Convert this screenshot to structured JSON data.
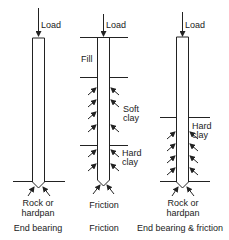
{
  "diagram": {
    "type": "pile foundation types",
    "piles": [
      {
        "id": "end-bearing",
        "load_label": "Load",
        "bearing_label": [
          "Rock or",
          "hardpan"
        ],
        "caption": "End bearing"
      },
      {
        "id": "friction",
        "load_label": "Load",
        "layers": [
          "Fill",
          "Soft clay",
          "Hard clay"
        ],
        "layer_labels": {
          "fill": "Fill",
          "soft_clay_1": "Soft",
          "soft_clay_2": "clay",
          "hard_clay_1": "Hard",
          "hard_clay_2": "clay"
        },
        "tip_label": "Friction",
        "caption": "Friction"
      },
      {
        "id": "end-bearing-friction",
        "load_label": "Load",
        "layer_labels": {
          "hard_clay_1": "Hard",
          "hard_clay_2": "clay"
        },
        "bearing_label": [
          "Rock or",
          "hardpan"
        ],
        "caption": "End bearing & friction"
      }
    ]
  },
  "colors": {
    "line": "#222222",
    "background": "#ffffff"
  }
}
